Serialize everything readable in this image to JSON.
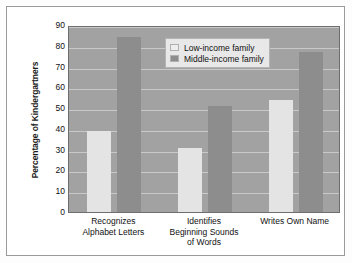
{
  "chart_data": {
    "type": "bar",
    "title": "",
    "xlabel": "",
    "ylabel": "Percentage of Kindergartners",
    "ylim": [
      0,
      90
    ],
    "ytick_step": 10,
    "yticks": [
      0,
      10,
      20,
      30,
      40,
      50,
      60,
      70,
      80,
      90
    ],
    "grid": true,
    "legend_position": "top-center",
    "categories": [
      "Recognizes\nAlphabet Letters",
      "Identifies\nBeginning Sounds\nof Words",
      "Writes Own Name"
    ],
    "category_lines": [
      [
        "Recognizes",
        "Alphabet Letters"
      ],
      [
        "Identifies",
        "Beginning Sounds",
        "of Words"
      ],
      [
        "Writes Own Name"
      ]
    ],
    "series": [
      {
        "name": "Low-income family",
        "color": "#e4e4e4",
        "values": [
          39,
          31,
          54
        ]
      },
      {
        "name": "Middle-income family",
        "color": "#8d8d8d",
        "values": [
          84,
          51,
          77
        ]
      }
    ]
  },
  "legend": {
    "items": [
      {
        "label": "Low-income family",
        "swatch": "low"
      },
      {
        "label": "Middle-income family",
        "swatch": "mid"
      }
    ]
  },
  "colors": {
    "plot_background": "#a2a2a2",
    "gridline": "#c9c9c9",
    "low_income_bar": "#e4e4e4",
    "middle_income_bar": "#8d8d8d",
    "frame_border": "#9a9a9a",
    "text": "#111111"
  }
}
